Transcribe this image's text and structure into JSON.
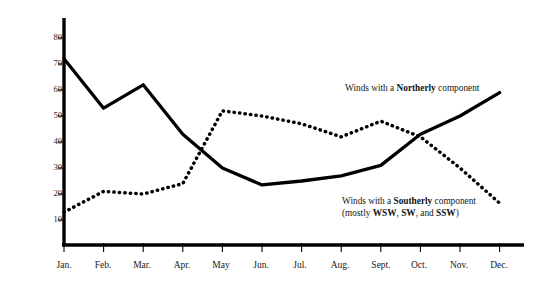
{
  "chart_data": {
    "type": "line",
    "title": "",
    "xlabel": "",
    "ylabel": "Percentage of Observations",
    "categories": [
      "Jan.",
      "Feb.",
      "Mar.",
      "Apr.",
      "May",
      "Jun.",
      "Jul.",
      "Aug.",
      "Sept.",
      "Oct.",
      "Nov.",
      "Dec."
    ],
    "ylim": [
      0,
      85
    ],
    "yticks": [
      10,
      20,
      30,
      40,
      50,
      60,
      70,
      80
    ],
    "ytick_labels": [
      "10",
      "20",
      "30",
      "40",
      "50",
      "60",
      "70",
      "80"
    ],
    "grid": false,
    "legend_position": "inline-annotations",
    "series": [
      {
        "name": "Winds with a Northerly component",
        "style": "solid",
        "color": "#000000",
        "values": [
          72,
          53,
          62,
          43,
          30,
          23.5,
          25,
          27,
          31,
          43,
          50,
          59
        ]
      },
      {
        "name": "Winds with a Southerly component (mostly WSW, SW, and SSW)",
        "style": "dotted",
        "color": "#000000",
        "values": [
          13,
          21,
          20,
          24,
          52,
          50,
          47,
          42,
          48,
          42,
          30,
          16.5
        ]
      }
    ],
    "annotations": [
      {
        "id": "northerly",
        "prefix": "Winds with a ",
        "emphasis": "Northerly",
        "suffix": " component",
        "line2": ""
      },
      {
        "id": "southerly",
        "prefix": "Winds with a ",
        "emphasis": "Southerly",
        "suffix": " component",
        "line2_prefix": "(mostly ",
        "line2_em1": "WSW",
        "line2_mid1": ", ",
        "line2_em2": "SW",
        "line2_mid2": ", and ",
        "line2_em3": "SSW",
        "line2_suffix": ")"
      }
    ]
  },
  "axes": {
    "y_axis_title": "Percentage of Observations",
    "y_tick_10": "10",
    "y_tick_20": "20",
    "y_tick_30": "30",
    "y_tick_40": "40",
    "y_tick_50": "50",
    "y_tick_60": "60",
    "y_tick_70": "70",
    "y_tick_80": "80",
    "x_tick_0": "Jan.",
    "x_tick_1": "Feb.",
    "x_tick_2": "Mar.",
    "x_tick_3": "Apr.",
    "x_tick_4": "May",
    "x_tick_5": "Jun.",
    "x_tick_6": "Jul.",
    "x_tick_7": "Aug.",
    "x_tick_8": "Sept.",
    "x_tick_9": "Oct.",
    "x_tick_10": "Nov.",
    "x_tick_11": "Dec."
  },
  "annotations": {
    "northerly_prefix": "Winds with a ",
    "northerly_emphasis": "Northerly",
    "northerly_suffix": " component",
    "southerly_prefix": "Winds with a ",
    "southerly_emphasis": "Southerly",
    "southerly_suffix": " component",
    "southerly_line2_prefix": "(mostly ",
    "southerly_line2_em1": "WSW",
    "southerly_line2_mid1": ", ",
    "southerly_line2_em2": "SW",
    "southerly_line2_mid2": ", and ",
    "southerly_line2_em3": "SSW",
    "southerly_line2_suffix": ")"
  },
  "style": {
    "axis_color": "#000000",
    "background": "#ffffff",
    "series_color": "#000000"
  }
}
